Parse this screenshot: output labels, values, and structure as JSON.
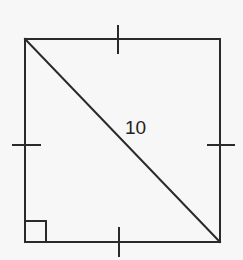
{
  "figure": {
    "type": "square-with-diagonal",
    "diagonal_label": "10",
    "tick_marks": 4,
    "right_angle_marker": "bottom-left",
    "colors": {
      "stroke": "#2a2a2a",
      "background": "#f7f7f7",
      "text": "#222222"
    }
  }
}
